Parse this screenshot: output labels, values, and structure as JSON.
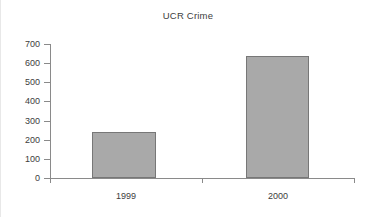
{
  "chart_data": {
    "type": "bar",
    "title": "UCR Crime",
    "xlabel": "",
    "ylabel": "",
    "categories": [
      "1999",
      "2000"
    ],
    "values": [
      240,
      635
    ],
    "series": [
      {
        "name": "UCR Crime",
        "values": [
          240,
          635
        ]
      }
    ],
    "ylim": [
      0,
      700
    ],
    "ytick_labels": [
      "0",
      "100",
      "200",
      "300",
      "400",
      "500",
      "600",
      "700"
    ],
    "ytick_values": [
      0,
      100,
      200,
      300,
      400,
      500,
      600,
      700
    ],
    "grid": false,
    "legend": "none",
    "bar_color": "#a9a9a9",
    "bar_border_color": "#777777",
    "axis_color": "#8a8a8a",
    "background": "#ffffff",
    "text_color": "#3d3d3d"
  }
}
